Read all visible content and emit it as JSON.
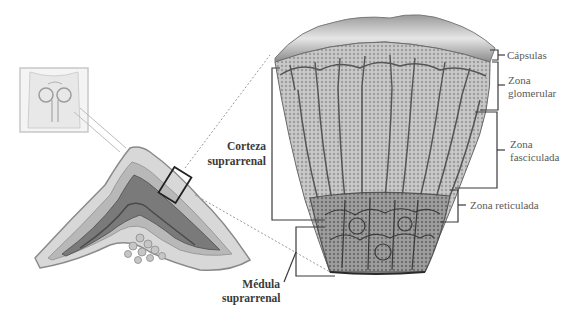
{
  "diagram": {
    "labels": {
      "cortex": [
        "Corteza",
        "suprarrenal"
      ],
      "medulla": [
        "Médula",
        "suprarrenal"
      ],
      "capsule": "Cápsulas",
      "zona_glomerular": [
        "Zona",
        "glomerular"
      ],
      "zona_fasciculada": [
        "Zona",
        "fasciculada"
      ],
      "zona_reticulada": "Zona reticulada"
    },
    "colors": {
      "line": "#3a3a3a",
      "tissue_light": "#d4d4d4",
      "tissue_mid": "#a8a8a8",
      "tissue_dark": "#6e6e6e",
      "dotted": "#9a9a9a"
    }
  }
}
